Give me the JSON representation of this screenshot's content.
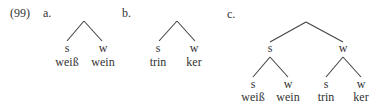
{
  "example": {
    "number": "(99)",
    "a": {
      "label": "a.",
      "root": "",
      "left": {
        "label": "s",
        "word": "weiß"
      },
      "right": {
        "label": "w",
        "word": "wein"
      }
    },
    "b": {
      "label": "b.",
      "root": "",
      "left": {
        "label": "s",
        "word": "trin"
      },
      "right": {
        "label": "w",
        "word": "ker"
      }
    },
    "c": {
      "label": "c.",
      "left": {
        "label": "s",
        "left": {
          "label": "s",
          "word": "weiß"
        },
        "right": {
          "label": "w",
          "word": "wein"
        }
      },
      "right": {
        "label": "w",
        "left": {
          "label": "s",
          "word": "trin"
        },
        "right": {
          "label": "w",
          "word": "ker"
        }
      }
    }
  }
}
